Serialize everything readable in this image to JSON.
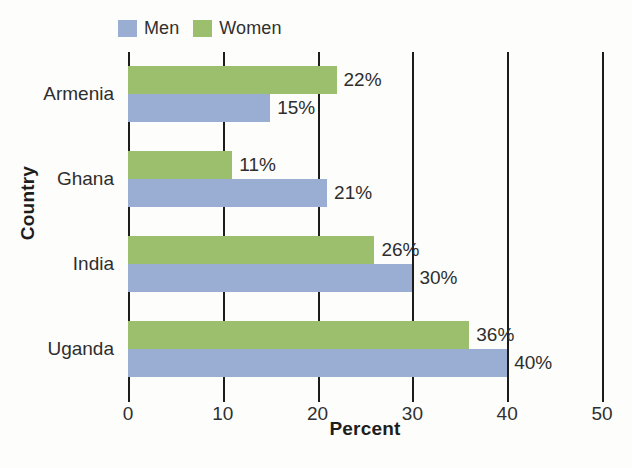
{
  "chart_data": {
    "type": "bar",
    "orientation": "horizontal",
    "title": "",
    "xlabel": "Percent",
    "ylabel": "Country",
    "categories": [
      "Armenia",
      "Ghana",
      "India",
      "Uganda"
    ],
    "series": [
      {
        "name": "Men",
        "color": "#9aaed4",
        "values": [
          15,
          21,
          30,
          40
        ],
        "value_labels": [
          "15%",
          "21%",
          "30%",
          "40%"
        ]
      },
      {
        "name": "Women",
        "color": "#9cbf6e",
        "values": [
          22,
          11,
          26,
          36
        ],
        "value_labels": [
          "22%",
          "11%",
          "26%",
          "36%"
        ]
      }
    ],
    "xlim": [
      0,
      50
    ],
    "xticks": [
      0,
      10,
      20,
      30,
      40,
      50
    ],
    "xtick_labels": [
      "0",
      "10",
      "20",
      "30",
      "40",
      "50"
    ],
    "grid": "vertical",
    "legend_position": "top-left",
    "series_order_top_to_bottom": [
      "Women",
      "Men"
    ]
  },
  "legend": {
    "entries": [
      {
        "label": "Men",
        "swatch_name": "legend-swatch-men"
      },
      {
        "label": "Women",
        "swatch_name": "legend-swatch-women"
      }
    ]
  },
  "axes": {
    "x_title": "Percent",
    "y_title": "Country"
  },
  "colors": {
    "men": "#9aaed4",
    "women": "#9cbf6e",
    "axis": "#1c1c1c",
    "text": "#2e2e2d",
    "background": "#fdfdfc"
  }
}
